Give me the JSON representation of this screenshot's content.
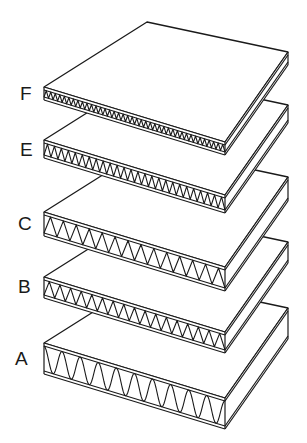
{
  "diagram": {
    "stroke_color": "#1a1a1a",
    "fill_color": "#ffffff",
    "boards": [
      {
        "label": "F",
        "label_x": 20,
        "label_y": 84,
        "top_y": 87,
        "flute_height": 7,
        "flute_count": 40,
        "wave": "triangle",
        "label_pos": "F"
      },
      {
        "label": "E",
        "label_x": 20,
        "label_y": 140,
        "top_y": 140,
        "flute_height": 12,
        "flute_count": 26,
        "wave": "triangle"
      },
      {
        "label": "C",
        "label_x": 18,
        "label_y": 214,
        "top_y": 212,
        "flute_height": 18,
        "flute_count": 14,
        "wave": "triangle"
      },
      {
        "label": "B",
        "label_x": 18,
        "label_y": 277,
        "top_y": 277,
        "flute_height": 15,
        "flute_count": 17,
        "wave": "triangle"
      },
      {
        "label": "A",
        "label_x": 15,
        "label_y": 349,
        "top_y": 343,
        "flute_height": 25,
        "flute_count": 10,
        "wave": "sine"
      }
    ],
    "geometry": {
      "left_x": 44,
      "front_x": 225,
      "right_x": 288,
      "back_dx_left_to_back": 103,
      "front_drop": 55,
      "back_rise": 65,
      "liner_thickness": 3
    }
  }
}
